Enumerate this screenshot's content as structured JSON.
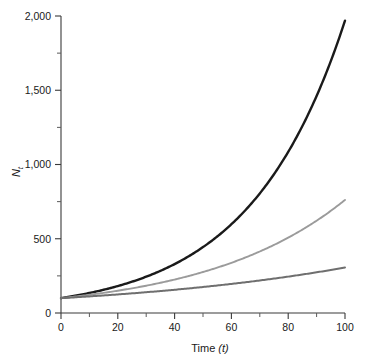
{
  "chart_data": {
    "type": "line",
    "title": "",
    "xlabel": "Time (t)",
    "ylabel": "N_t",
    "xlim": [
      0,
      100
    ],
    "ylim": [
      0,
      2000
    ],
    "grid": false,
    "legend": "none",
    "x_ticks": [
      0,
      20,
      40,
      60,
      80,
      100
    ],
    "x_tick_labels": [
      "0",
      "20",
      "40",
      "60",
      "80",
      "100"
    ],
    "x_minor_ticks": [
      10,
      30,
      50,
      70,
      90
    ],
    "y_ticks": [
      0,
      500,
      1000,
      1500,
      2000
    ],
    "y_tick_labels": [
      "0",
      "500",
      "1,000",
      "1,500",
      "2,000"
    ],
    "y_minor_ticks": [
      250,
      750,
      1250,
      1750
    ],
    "x": [
      0,
      5,
      10,
      15,
      20,
      25,
      30,
      35,
      40,
      45,
      50,
      55,
      60,
      65,
      70,
      75,
      80,
      85,
      90,
      95,
      100
    ],
    "series": [
      {
        "name": "high-growth",
        "color": "#1a1a1a",
        "width": 2.4,
        "n0": 100,
        "r": 0.0298,
        "values": [
          100,
          116,
          135,
          156,
          181,
          211,
          245,
          284,
          330,
          383,
          445,
          516,
          599,
          696,
          808,
          938,
          1089,
          1264,
          1467,
          1703,
          1950
        ]
      },
      {
        "name": "medium-growth",
        "color": "#9b9b9b",
        "width": 1.9,
        "n0": 100,
        "r": 0.0203,
        "values": [
          100,
          111,
          123,
          136,
          150,
          166,
          184,
          203,
          225,
          249,
          275,
          305,
          337,
          373,
          413,
          457,
          505,
          559,
          619,
          685,
          758
        ]
      },
      {
        "name": "low-growth",
        "color": "#6f6f6f",
        "width": 2.0,
        "n0": 100,
        "r": 0.0112,
        "values": [
          100,
          106,
          112,
          118,
          125,
          132,
          140,
          148,
          156,
          166,
          175,
          185,
          196,
          207,
          219,
          231,
          245,
          259,
          274,
          289,
          306
        ]
      }
    ]
  }
}
